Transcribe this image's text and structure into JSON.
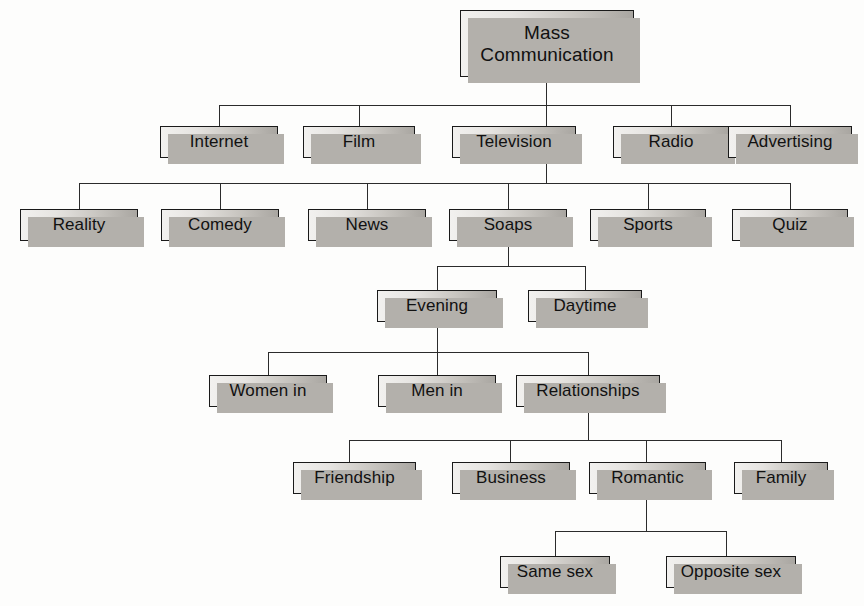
{
  "diagram": {
    "type": "tree-hierarchy",
    "background_color": "#fdfdfc",
    "node_border_color": "#1a1a1a",
    "node_fill_light": "#f2f1ef",
    "node_fill_dark": "#a9a6a1",
    "shadow_color": "#b3b0ab",
    "connector_color": "#2b2b2b",
    "levels": [
      {
        "level": 1,
        "labels": [
          "Mass Communication"
        ]
      },
      {
        "level": 2,
        "labels": [
          "Internet",
          "Film",
          "Television",
          "Radio",
          "Advertising"
        ]
      },
      {
        "level": 3,
        "labels": [
          "Reality",
          "Comedy",
          "News",
          "Soaps",
          "Sports",
          "Quiz"
        ]
      },
      {
        "level": 4,
        "labels": [
          "Evening",
          "Daytime"
        ]
      },
      {
        "level": 5,
        "labels": [
          "Women in",
          "Men in",
          "Relationships"
        ]
      },
      {
        "level": 6,
        "labels": [
          "Friendship",
          "Business",
          "Romantic",
          "Family"
        ]
      },
      {
        "level": 7,
        "labels": [
          "Same sex",
          "Opposite sex"
        ]
      }
    ],
    "edges": [
      {
        "from": "Mass Communication",
        "to": [
          "Internet",
          "Film",
          "Television",
          "Radio",
          "Advertising"
        ]
      },
      {
        "from": "Television",
        "to": [
          "Reality",
          "Comedy",
          "News",
          "Soaps",
          "Sports",
          "Quiz"
        ]
      },
      {
        "from": "Soaps",
        "to": [
          "Evening",
          "Daytime"
        ]
      },
      {
        "from": "Evening",
        "to": [
          "Women in",
          "Men in",
          "Relationships"
        ]
      },
      {
        "from": "Relationships",
        "to": [
          "Friendship",
          "Business",
          "Romantic",
          "Family"
        ]
      },
      {
        "from": "Romantic",
        "to": [
          "Same sex",
          "Opposite sex"
        ]
      }
    ]
  },
  "nodes": {
    "root": {
      "label": "Mass Communication",
      "line1": "Mass",
      "line2": "Communication"
    },
    "internet": {
      "label": "Internet"
    },
    "film": {
      "label": "Film"
    },
    "television": {
      "label": "Television"
    },
    "radio": {
      "label": "Radio"
    },
    "advertising": {
      "label": "Advertising"
    },
    "reality": {
      "label": "Reality"
    },
    "comedy": {
      "label": "Comedy"
    },
    "news": {
      "label": "News"
    },
    "soaps": {
      "label": "Soaps"
    },
    "sports": {
      "label": "Sports"
    },
    "quiz": {
      "label": "Quiz"
    },
    "evening": {
      "label": "Evening"
    },
    "daytime": {
      "label": "Daytime"
    },
    "women_in": {
      "label": "Women in"
    },
    "men_in": {
      "label": "Men in"
    },
    "relationships": {
      "label": "Relationships"
    },
    "friendship": {
      "label": "Friendship"
    },
    "business": {
      "label": "Business"
    },
    "romantic": {
      "label": "Romantic"
    },
    "family": {
      "label": "Family"
    },
    "same_sex": {
      "label": "Same sex"
    },
    "opposite_sex": {
      "label": "Opposite sex"
    }
  }
}
